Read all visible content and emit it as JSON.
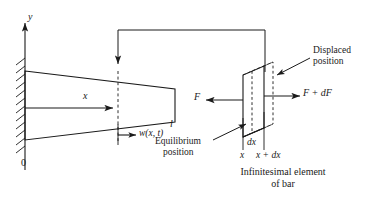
{
  "figure": {
    "type": "engineering-diagram",
    "colors": {
      "line": "#1a1a1a",
      "background": "#ffffff",
      "text": "#1a1a1a"
    }
  },
  "axes": {
    "y_label": "y",
    "origin_label": "0"
  },
  "bar": {
    "x_label": "x",
    "length_label": "l",
    "displacement_label": "w(x, t)"
  },
  "element": {
    "force_left_label": "F",
    "force_right_label": "F + dF",
    "displaced_label_line1": "Displaced",
    "displaced_label_line2": "position",
    "equilibrium_label_line1": "Equilibrium",
    "equilibrium_label_line2": "position",
    "dx_label": "dx",
    "x_label": "x",
    "x_plus_dx_label": "x + dx",
    "caption_line1": "Infinitesimal element",
    "caption_line2": "of bar"
  }
}
